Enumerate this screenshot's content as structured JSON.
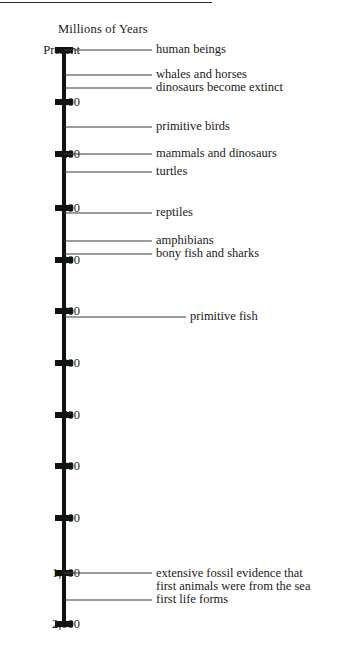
{
  "chart_data": {
    "type": "table",
    "title": "Millions of Years",
    "subtitle": "",
    "xlabel": "",
    "ylabel": "Millions of Years",
    "orientation": "vertical-timeline",
    "grid": false,
    "legend": null,
    "axis_direction": "Present at top, oldest at bottom",
    "scale_note": "Linear from Present to 1,000 million years; compressed jump from 1,000 to 2,000 million years",
    "axis_ticks": [
      {
        "label": "Present",
        "value": 0,
        "y": 50
      },
      {
        "label": "100",
        "value": 100,
        "y": 102
      },
      {
        "label": "200",
        "value": 200,
        "y": 154
      },
      {
        "label": "300",
        "value": 300,
        "y": 208
      },
      {
        "label": "400",
        "value": 400,
        "y": 260
      },
      {
        "label": "500",
        "value": 500,
        "y": 311
      },
      {
        "label": "600",
        "value": 600,
        "y": 363
      },
      {
        "label": "700",
        "value": 700,
        "y": 415
      },
      {
        "label": "800",
        "value": 800,
        "y": 466
      },
      {
        "label": "900",
        "value": 900,
        "y": 518
      },
      {
        "label": "1,000",
        "value": 1000,
        "y": 573
      },
      {
        "label": "2,000",
        "value": 2000,
        "y": 624
      }
    ],
    "events": [
      {
        "label": "human beings",
        "value": 0,
        "y": 50,
        "leader_width": 88,
        "text_x": 156
      },
      {
        "label": "whales and horses",
        "value": 50,
        "y": 75,
        "leader_width": 88,
        "text_x": 156
      },
      {
        "label": "dinosaurs become extinct",
        "value": 75,
        "y": 88,
        "leader_width": 88,
        "text_x": 156
      },
      {
        "label": "primitive birds",
        "value": 145,
        "y": 127,
        "leader_width": 88,
        "text_x": 156
      },
      {
        "label": "mammals and dinosaurs",
        "value": 200,
        "y": 154,
        "leader_width": 88,
        "text_x": 156
      },
      {
        "label": "turtles",
        "value": 225,
        "y": 172,
        "leader_width": 88,
        "text_x": 156
      },
      {
        "label": "reptiles",
        "value": 310,
        "y": 213,
        "leader_width": 88,
        "text_x": 156
      },
      {
        "label": "amphibians",
        "value": 365,
        "y": 241,
        "leader_width": 88,
        "text_x": 156
      },
      {
        "label": "bony fish and sharks",
        "value": 390,
        "y": 254,
        "leader_width": 88,
        "text_x": 156
      },
      {
        "label": "primitive fish",
        "value": 510,
        "y": 317,
        "leader_width": 122,
        "text_x": 190
      },
      {
        "label": "extensive fossil evidence that\nfirst animals were from the sea",
        "value": 1000,
        "y": 573,
        "leader_width": 88,
        "text_x": 156
      },
      {
        "label": "first life forms",
        "value": 1500,
        "y": 600,
        "leader_width": 88,
        "text_x": 156
      }
    ],
    "colors": {
      "axis": "#111111",
      "leader": "#3a3a3a",
      "text": "#1a1a1a",
      "background": "#ffffff"
    }
  }
}
